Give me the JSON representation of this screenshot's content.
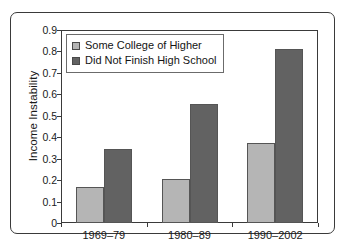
{
  "chart_data": {
    "type": "bar",
    "title": "",
    "xlabel": "",
    "ylabel": "Income Instability",
    "categories": [
      "1969–79",
      "1980–89",
      "1990–2002"
    ],
    "series": [
      {
        "name": "Some College of Higher",
        "color": "#b5b5b5",
        "values": [
          0.17,
          0.205,
          0.375
        ]
      },
      {
        "name": "Did Not Finish High School",
        "color": "#626262",
        "values": [
          0.345,
          0.555,
          0.81
        ]
      }
    ],
    "ylim": [
      0,
      0.9
    ],
    "ytick_step": 0.1,
    "ytick_labels": [
      "0.9",
      "0.8",
      "0.7",
      "0.6",
      "0.5",
      "0.4",
      "0.3",
      "0.2",
      "0.1",
      "0"
    ],
    "ytick_values": [
      0.9,
      0.8,
      0.7,
      0.6,
      0.5,
      0.4,
      0.3,
      0.2,
      0.1,
      0
    ],
    "grid": false,
    "legend_position": "top-left",
    "axis_color": "#3a3a3a",
    "background_color": "#ffffff"
  }
}
